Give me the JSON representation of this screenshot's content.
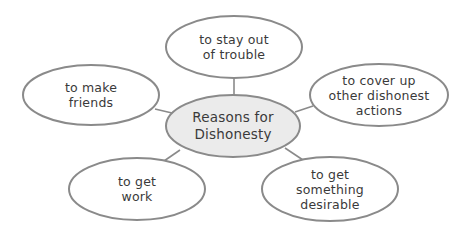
{
  "diagram": {
    "type": "concept-map",
    "colors": {
      "stroke": "#8a8a8a",
      "center_fill": "#ebebeb",
      "node_fill": "#ffffff",
      "text": "#3a3a3a"
    },
    "center": {
      "lines": [
        "Reasons for",
        "Dishonesty"
      ]
    },
    "nodes": [
      {
        "id": "top",
        "lines": [
          "to stay out",
          "of trouble"
        ]
      },
      {
        "id": "left",
        "lines": [
          "to make",
          "friends"
        ]
      },
      {
        "id": "right",
        "lines": [
          "to cover up",
          "other dishonest",
          "actions"
        ]
      },
      {
        "id": "bottom-left",
        "lines": [
          "to get",
          "work"
        ]
      },
      {
        "id": "bottom-right",
        "lines": [
          "to get",
          "something",
          "desirable"
        ]
      }
    ]
  }
}
